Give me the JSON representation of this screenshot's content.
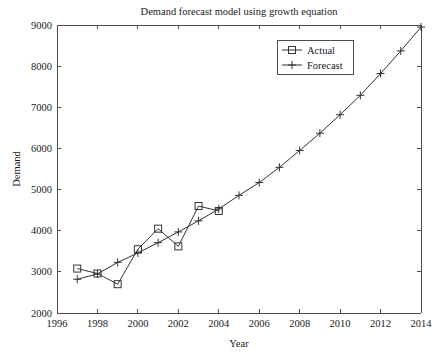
{
  "chart_data": {
    "type": "line",
    "title": "Demand forecast model using growth equation",
    "xlabel": "Year",
    "ylabel": "Demand",
    "xlim": [
      1996,
      2014
    ],
    "ylim": [
      2000,
      9000
    ],
    "xticks": [
      1996,
      1998,
      2000,
      2002,
      2004,
      2006,
      2008,
      2010,
      2012,
      2014
    ],
    "xtick_labels": [
      "1996",
      "1998",
      "2000",
      "2002",
      "2004",
      "2006",
      "2008",
      "2010",
      "2012",
      "2014"
    ],
    "yticks": [
      2000,
      3000,
      4000,
      5000,
      6000,
      7000,
      8000,
      9000
    ],
    "ytick_labels": [
      "2000",
      "3000",
      "4000",
      "5000",
      "6000",
      "7000",
      "8000",
      "9000"
    ],
    "grid": false,
    "legend_position": "upper center",
    "line_color": "#333333",
    "axis_color": "#4d4d4d",
    "background_color": "#ffffff",
    "series": [
      {
        "name": "Actual",
        "marker": "square",
        "x": [
          1997,
          1998,
          1999,
          2000,
          2001,
          2002,
          2003,
          2004
        ],
        "values": [
          3080,
          2960,
          2700,
          3550,
          4050,
          3620,
          4600,
          4480
        ]
      },
      {
        "name": "Forecast",
        "marker": "plus",
        "x": [
          1997,
          1998,
          1999,
          2000,
          2001,
          2002,
          2003,
          2004,
          2005,
          2006,
          2007,
          2008,
          2009,
          2010,
          2011,
          2012,
          2013,
          2014
        ],
        "values": [
          2820,
          2950,
          3230,
          3460,
          3710,
          3970,
          4240,
          4530,
          4860,
          5170,
          5540,
          5950,
          6370,
          6820,
          7290,
          7820,
          8370,
          8950
        ]
      }
    ]
  },
  "legend": {
    "entries": [
      {
        "label": "Actual",
        "marker": "square"
      },
      {
        "label": "Forecast",
        "marker": "plus"
      }
    ]
  }
}
